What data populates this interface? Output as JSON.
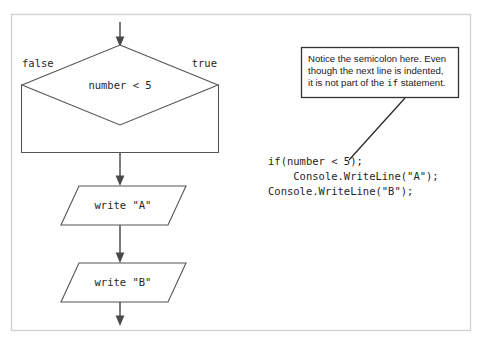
{
  "figure": {
    "kind": "flowchart-with-code-annotation",
    "background": "#ffffff",
    "frame_color": "#d2d2d2",
    "shape_stroke": "#555555",
    "connector_stroke": "#5a5a5a",
    "callout_stroke": "#333333"
  },
  "flowchart": {
    "entry_arrow": "down-arrow-into-decision",
    "decision": {
      "condition": "number < 5",
      "false_label": "false",
      "true_label": "true"
    },
    "merge_block": {
      "description": "rectangle joining false and true branches"
    },
    "steps": [
      {
        "shape": "parallelogram",
        "text": "write \"A\""
      },
      {
        "shape": "parallelogram",
        "text": "write \"B\""
      }
    ],
    "exit_arrow": "down-arrow-out-of-flow"
  },
  "callout": {
    "lines": [
      {
        "pre": "Notice the semicolon here. Even",
        "kw": "",
        "post": ""
      },
      {
        "pre": "though the next line is indented,",
        "kw": "",
        "post": ""
      },
      {
        "pre": "it is not part of the ",
        "kw": "if",
        "post": " statement."
      }
    ],
    "leader": "line-to-semicolon"
  },
  "code": {
    "lines": [
      "if(number < 5);",
      "    Console.WriteLine(\"A\");",
      "Console.WriteLine(\"B\");"
    ]
  }
}
